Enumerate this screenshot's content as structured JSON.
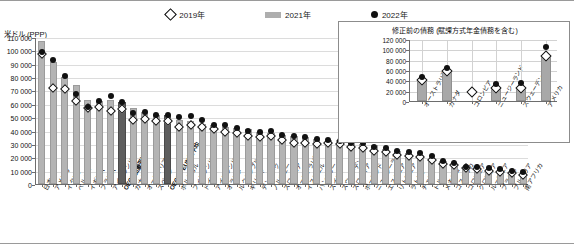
{
  "legend": {
    "items": [
      {
        "label": "2019年",
        "marker": "diamond-outline-icon"
      },
      {
        "label": "2021年",
        "marker": "gray-bar-icon"
      },
      {
        "label": "2022年",
        "marker": "black-dot-icon"
      }
    ]
  },
  "main": {
    "ylabel": "米ドル (PPP)"
  },
  "inset": {
    "title": "修正前の債務 (賦課方式年金債務を含む)"
  },
  "chart_data": [
    {
      "type": "bar",
      "title": "",
      "xlabel": "",
      "ylabel": "米ドル (PPP)",
      "ylim": [
        0,
        110000
      ],
      "ytick_values": [
        0,
        10000,
        20000,
        30000,
        40000,
        50000,
        60000,
        70000,
        80000,
        90000,
        100000,
        110000
      ],
      "ytick_labels": [
        "0",
        "10 000",
        "20 000",
        "30 000",
        "40 000",
        "50 000",
        "60 000",
        "70 000",
        "80 000",
        "90 000",
        "100 000",
        "110 000"
      ],
      "grid": true,
      "legend_position": "top-center",
      "highlight_categories": [
        "OECD加重平均",
        "OECD・EU加重平均"
      ],
      "categories": [
        "日本",
        "アメリカ",
        "イタリア",
        "ベルギー",
        "イギリス",
        "フランス",
        "アイルランド",
        "OECD加重平均",
        "カナダ",
        "オーストリア",
        "スペイン",
        "OECD・EU加重平均",
        "ポルトガル",
        "フィンランド",
        "ドイツ",
        "アイスランド",
        "オランダ",
        "ルクセンブルク",
        "ギリシャ",
        "デンマーク",
        "ノルウェー",
        "スロベニア",
        "オーストラリア",
        "イスラエル",
        "ハンガリー",
        "スイス",
        "スウェーデン",
        "スロバキア",
        "ポーランド",
        "ニュージーランド",
        "エストニア",
        "リトアニア",
        "ラトビア",
        "チェコ",
        "トルコ",
        "メキシコ",
        "コスタリカ",
        "コロンビア",
        "クロアチア",
        "ルーマニア",
        "ブラジル",
        "ブルガリア",
        "南アフリカ"
      ],
      "series": [
        {
          "name": "2021年",
          "type": "bar",
          "values": [
            107000,
            91000,
            80000,
            74000,
            63000,
            62000,
            63000,
            61000,
            57000,
            54000,
            52000,
            52000,
            48000,
            47000,
            45000,
            44000,
            43000,
            42000,
            41000,
            39000,
            38000,
            37000,
            36000,
            35000,
            34000,
            33000,
            33000,
            31000,
            30000,
            29000,
            26000,
            25000,
            23000,
            22000,
            19000,
            17000,
            15000,
            13000,
            12000,
            11000,
            10000,
            9000,
            8000
          ]
        },
        {
          "name": "2022年",
          "type": "scatter-dot",
          "values": [
            99000,
            93000,
            81000,
            67000,
            58000,
            62000,
            66000,
            61000,
            53000,
            54000,
            52000,
            52000,
            50000,
            51000,
            48000,
            44000,
            44000,
            42000,
            40000,
            39000,
            40000,
            37000,
            36000,
            35000,
            34000,
            33000,
            32000,
            31000,
            31000,
            28000,
            27000,
            25000,
            24000,
            23000,
            21000,
            17000,
            16000,
            13000,
            13000,
            12000,
            11000,
            10000,
            9000
          ]
        },
        {
          "name": "2019年",
          "type": "scatter-diamond",
          "values": [
            97000,
            72000,
            71000,
            62000,
            57000,
            58000,
            55000,
            56000,
            48000,
            49000,
            47000,
            47000,
            43000,
            44000,
            43000,
            41000,
            39000,
            38000,
            36000,
            35000,
            36000,
            33000,
            31000,
            31000,
            30000,
            31000,
            30000,
            28000,
            27000,
            25000,
            24000,
            22000,
            21000,
            20000,
            18000,
            15000,
            14000,
            12000,
            11000,
            10000,
            9000,
            8000,
            7000
          ]
        }
      ]
    },
    {
      "type": "bar",
      "title": "修正前の債務 (賦課方式年金債務を含む)",
      "xlabel": "",
      "ylabel": "",
      "ylim": [
        0,
        120000
      ],
      "ytick_values": [
        0,
        20000,
        40000,
        60000,
        80000,
        100000,
        120000
      ],
      "ytick_labels": [
        "0",
        "20 000",
        "40 000",
        "60 000",
        "80 000",
        "100 000",
        "120 000"
      ],
      "grid": true,
      "categories": [
        "オーストラリア",
        "カナダ",
        "コロンビア",
        "ニュージーランド",
        "スウェーデン",
        "アメリカ"
      ],
      "series": [
        {
          "name": "2021年",
          "type": "bar",
          "values": [
            38000,
            57000,
            0,
            25000,
            28000,
            86000
          ]
        },
        {
          "name": "2022年",
          "type": "scatter-dot",
          "values": [
            46000,
            63000,
            0,
            33000,
            35000,
            105000
          ]
        },
        {
          "name": "2019年",
          "type": "scatter-diamond",
          "values": [
            40000,
            58000,
            18000,
            25000,
            25000,
            88000
          ]
        }
      ]
    }
  ]
}
